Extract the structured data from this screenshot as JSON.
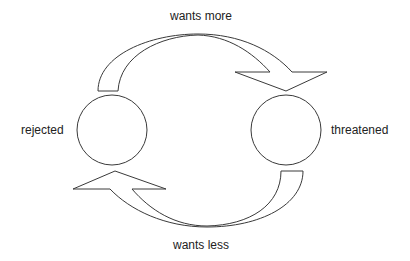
{
  "diagram": {
    "type": "cycle",
    "nodes": [
      {
        "id": "rejected",
        "label": "rejected",
        "shape": "circle",
        "cx": 112,
        "cy": 130,
        "r": 35
      },
      {
        "id": "threatened",
        "label": "threatened",
        "shape": "circle",
        "cx": 286,
        "cy": 130,
        "r": 35
      }
    ],
    "edges": [
      {
        "from": "rejected",
        "to": "threatened",
        "label": "wants more",
        "position": "top",
        "shape": "curved-block-arrow"
      },
      {
        "from": "threatened",
        "to": "rejected",
        "label": "wants less",
        "position": "bottom",
        "shape": "curved-block-arrow"
      }
    ],
    "colors": {
      "stroke": "#3a3a3a",
      "fill": "#ffffff",
      "text": "#222222",
      "background": "#ffffff"
    }
  },
  "labels": {
    "top": "wants more",
    "bottom": "wants less",
    "left": "rejected",
    "right": "threatened"
  }
}
